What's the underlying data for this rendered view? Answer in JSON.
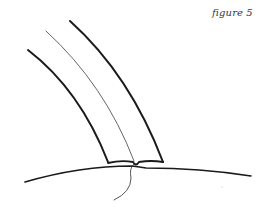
{
  "figure": {
    "caption": "figure 5",
    "ink_color": "#1a1a1a",
    "thin_ink_color": "#555555",
    "background": "#ffffff"
  },
  "drawing": {
    "elements": [
      {
        "name": "strip-left-edge",
        "description": "thick curved outer edge of strip"
      },
      {
        "name": "strip-center-line",
        "description": "thin curved center line"
      },
      {
        "name": "strip-right-edge",
        "description": "thick curved inner edge of strip"
      },
      {
        "name": "strip-base",
        "description": "base of strip meeting surface, folded at center"
      },
      {
        "name": "surface-curve",
        "description": "convex surface line"
      },
      {
        "name": "thread",
        "description": "thread hanging below the join"
      }
    ]
  }
}
